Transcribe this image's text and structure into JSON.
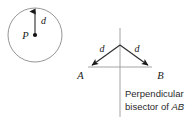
{
  "figure": {
    "background_color": "#ffffff",
    "line_color": "#2b2b2b",
    "light_line_color": "#8a8a8a"
  },
  "left_panel": {
    "name": "circle-radius-diagram",
    "center_label": "P",
    "radius_label": "d",
    "circle": {
      "cx": 35,
      "cy": 35,
      "r": 27
    }
  },
  "right_panel": {
    "name": "perpendicular-bisector-diagram",
    "apex_left_label": "d",
    "apex_right_label": "d",
    "point_a_label": "A",
    "point_b_label": "B",
    "caption_line_1": "Perpendicular",
    "caption_line_2_prefix": "bisector of ",
    "caption_line_2_segment": "AB",
    "apex": {
      "x": 120,
      "y": 45
    },
    "point_a": {
      "x": 88,
      "y": 67
    },
    "point_b": {
      "x": 152,
      "y": 67
    },
    "bisector": {
      "x": 120,
      "y_top": 28,
      "y_bottom": 117
    }
  }
}
